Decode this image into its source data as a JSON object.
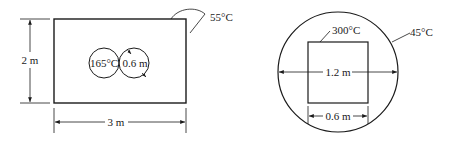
{
  "figures": [
    {
      "id": "rectangular-enclosure",
      "enclosure": {
        "width_label": "3 m",
        "height_label": "2 m",
        "surface_temp_label": "55°C"
      },
      "cylinders": {
        "temp_label": "165°C",
        "diameter_label": "0.6 m",
        "count": 2
      }
    },
    {
      "id": "cylindrical-enclosure",
      "enclosure": {
        "diameter_label": "1.2 m",
        "surface_temp_label": "45°C"
      },
      "square": {
        "side_label": "0.6 m",
        "temp_label": "300°C"
      }
    }
  ],
  "colors": {
    "ink": "#1a1a1a",
    "background": "#ffffff"
  }
}
